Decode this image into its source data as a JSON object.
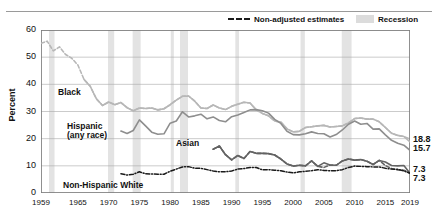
{
  "figure": {
    "title": "",
    "legend": [
      {
        "key": "non_adjusted",
        "label": "Non-adjusted estimates",
        "marker": "dashed-line"
      },
      {
        "key": "recession",
        "label": "Recession",
        "marker": "gray-band"
      }
    ],
    "end_labels": [
      "18.8",
      "15.7",
      "7.3",
      "7.3"
    ],
    "series_tags": {
      "black": "Black",
      "hispanic_line1": "Hispanic",
      "hispanic_line2": "(any race)",
      "asian": "Asian",
      "white": "Non-Hispanic White"
    }
  },
  "chart_data": {
    "type": "line",
    "title": "",
    "xlabel": "",
    "ylabel": "Percent",
    "xlim": [
      1959,
      2019
    ],
    "ylim": [
      0,
      60
    ],
    "ytick_labels": [
      "0",
      "10",
      "20",
      "30",
      "40",
      "50",
      "60"
    ],
    "ytick_values": [
      0,
      10,
      20,
      30,
      40,
      50,
      60
    ],
    "xtick_labels": [
      "1959",
      "1965",
      "1970",
      "1975",
      "1980",
      "1985",
      "1990",
      "1995",
      "2000",
      "2005",
      "2010",
      "2015",
      "2019"
    ],
    "xtick_values": [
      1959,
      1965,
      1970,
      1975,
      1980,
      1985,
      1990,
      1995,
      2000,
      2005,
      2010,
      2015,
      2019
    ],
    "grid": "horizontal",
    "legend_position": "top-right",
    "colors": {
      "black": "#b7b7b7",
      "hispanic": "#8e8e8e",
      "asian": "#636363",
      "white": "#1a1a1a",
      "recession_band": "#e3e3e3",
      "axis": "#7d7d7d"
    },
    "recession_bands": [
      {
        "start": 1960.3,
        "end": 1961.2
      },
      {
        "start": 1969.9,
        "end": 1970.9
      },
      {
        "start": 1973.9,
        "end": 1975.2
      },
      {
        "start": 1980.1,
        "end": 1980.6
      },
      {
        "start": 1981.6,
        "end": 1982.9
      },
      {
        "start": 1990.6,
        "end": 1991.2
      },
      {
        "start": 2001.2,
        "end": 2001.9
      },
      {
        "start": 2007.9,
        "end": 2009.5
      }
    ],
    "series": [
      {
        "name": "Black",
        "style": "solid",
        "color": "#b7b7b7",
        "end_value": 18.8,
        "x": [
          1966,
          1967,
          1968,
          1969,
          1970,
          1971,
          1972,
          1973,
          1974,
          1975,
          1976,
          1977,
          1978,
          1979,
          1980,
          1981,
          1982,
          1983,
          1984,
          1985,
          1986,
          1987,
          1988,
          1989,
          1990,
          1991,
          1992,
          1993,
          1994,
          1995,
          1996,
          1997,
          1998,
          1999,
          2000,
          2001,
          2002,
          2003,
          2004,
          2005,
          2006,
          2007,
          2008,
          2009,
          2010,
          2011,
          2012,
          2013,
          2014,
          2015,
          2016,
          2017,
          2018,
          2019
        ],
        "y": [
          41.8,
          39.3,
          34.7,
          32.2,
          33.5,
          32.5,
          33.3,
          31.4,
          30.3,
          31.3,
          31.1,
          31.3,
          30.6,
          31.0,
          32.5,
          34.2,
          35.6,
          35.7,
          33.8,
          31.3,
          31.1,
          32.4,
          31.3,
          30.7,
          31.9,
          32.7,
          33.4,
          33.1,
          30.6,
          29.3,
          28.4,
          26.5,
          26.1,
          23.6,
          22.5,
          22.7,
          24.1,
          24.4,
          24.7,
          24.9,
          24.3,
          24.5,
          24.7,
          25.8,
          27.4,
          27.6,
          27.2,
          27.2,
          26.2,
          24.1,
          22.0,
          21.2,
          20.8,
          18.8
        ]
      },
      {
        "name": "Black (non-adjusted)",
        "style": "dashed",
        "color": "#b7b7b7",
        "x": [
          1959,
          1960,
          1961,
          1962,
          1963,
          1964,
          1965,
          1966,
          1967,
          1968,
          1969,
          1970,
          1971,
          1972,
          1973,
          1974,
          1975,
          1976,
          1977,
          1978,
          1979,
          1980,
          1981,
          1982,
          1983,
          1984,
          1985,
          1986,
          1987,
          1988,
          1989,
          1990,
          1991,
          1992,
          1993,
          1994,
          1995,
          1996,
          1997,
          1998,
          1999,
          2000,
          2001,
          2002,
          2003,
          2004,
          2005,
          2006,
          2007,
          2008,
          2009,
          2010,
          2011,
          2012,
          2013,
          2014,
          2015,
          2016,
          2017,
          2018,
          2019
        ],
        "y": [
          55.1,
          55.9,
          52.3,
          53.8,
          51.0,
          49.6,
          47.1,
          41.8,
          39.3,
          34.7,
          32.2,
          33.5,
          32.5,
          33.3,
          31.4,
          30.3,
          31.3,
          31.1,
          31.3,
          30.6,
          31.0,
          32.5,
          34.2,
          35.6,
          35.7,
          33.8,
          31.3,
          31.1,
          32.4,
          31.3,
          30.7,
          31.9,
          32.7,
          33.4,
          33.1,
          30.6,
          29.3,
          28.4,
          26.5,
          26.1,
          23.6,
          22.5,
          22.7,
          24.1,
          24.4,
          24.7,
          24.9,
          24.3,
          24.5,
          24.7,
          25.8,
          27.4,
          27.6,
          27.2,
          27.2,
          26.2,
          24.1,
          22.0,
          21.2,
          20.8,
          19.9
        ]
      },
      {
        "name": "Hispanic (any race)",
        "style": "solid",
        "color": "#8e8e8e",
        "end_value": 15.7,
        "x": [
          1972,
          1973,
          1974,
          1975,
          1976,
          1977,
          1978,
          1979,
          1980,
          1981,
          1982,
          1983,
          1984,
          1985,
          1986,
          1987,
          1988,
          1989,
          1990,
          1991,
          1992,
          1993,
          1994,
          1995,
          1996,
          1997,
          1998,
          1999,
          2000,
          2001,
          2002,
          2003,
          2004,
          2005,
          2006,
          2007,
          2008,
          2009,
          2010,
          2011,
          2012,
          2013,
          2014,
          2015,
          2016,
          2017,
          2018,
          2019
        ],
        "y": [
          22.8,
          21.9,
          23.0,
          26.9,
          24.7,
          22.4,
          21.6,
          21.8,
          25.7,
          26.5,
          29.9,
          28.0,
          28.4,
          29.0,
          27.3,
          28.0,
          26.7,
          26.2,
          28.1,
          28.7,
          29.6,
          30.6,
          30.7,
          30.3,
          29.4,
          27.1,
          25.6,
          22.7,
          21.5,
          21.4,
          21.8,
          22.5,
          21.9,
          21.8,
          20.6,
          21.5,
          23.2,
          25.3,
          26.5,
          25.3,
          25.6,
          23.5,
          23.6,
          21.4,
          19.4,
          18.3,
          17.6,
          15.7
        ]
      },
      {
        "name": "Asian",
        "style": "solid",
        "color": "#636363",
        "end_value": 7.3,
        "x": [
          1987,
          1988,
          1989,
          1990,
          1991,
          1992,
          1993,
          1994,
          1995,
          1996,
          1997,
          1998,
          1999,
          2000,
          2001,
          2002,
          2003,
          2004,
          2005,
          2006,
          2007,
          2008,
          2009,
          2010,
          2011,
          2012,
          2013,
          2014,
          2015,
          2016,
          2017,
          2018,
          2019
        ],
        "y": [
          16.1,
          17.3,
          14.1,
          12.2,
          13.8,
          12.7,
          15.3,
          14.6,
          14.6,
          14.5,
          14.0,
          12.5,
          10.7,
          9.9,
          10.2,
          10.0,
          11.8,
          9.8,
          11.1,
          10.3,
          10.2,
          11.8,
          12.5,
          12.1,
          12.3,
          11.7,
          10.5,
          12.0,
          11.4,
          10.1,
          10.0,
          10.1,
          7.3
        ]
      },
      {
        "name": "Asian (non-adjusted)",
        "style": "dashed",
        "color": "#636363",
        "x": [
          1987,
          1988,
          1989,
          1990,
          1991,
          1992,
          1993,
          1994,
          1995,
          1996,
          1997,
          1998,
          1999,
          2000,
          2001,
          2002,
          2003,
          2004,
          2005,
          2006,
          2007,
          2008,
          2009,
          2010,
          2011,
          2012,
          2013,
          2014,
          2015,
          2016,
          2017,
          2018,
          2019
        ],
        "y": [
          16.1,
          17.3,
          14.1,
          12.2,
          13.8,
          12.7,
          15.3,
          14.6,
          14.6,
          14.5,
          14.0,
          12.5,
          10.7,
          9.9,
          10.2,
          10.0,
          11.8,
          9.8,
          9.4,
          10.3,
          10.2,
          11.8,
          12.5,
          12.1,
          12.3,
          11.7,
          10.5,
          12.0,
          10.1,
          9.0,
          8.5,
          8.4,
          7.3
        ]
      },
      {
        "name": "Non-Hispanic White",
        "style": "dash-dot",
        "color": "#1a1a1a",
        "end_value": 7.3,
        "x": [
          1972,
          1973,
          1974,
          1975,
          1976,
          1977,
          1978,
          1979,
          1980,
          1981,
          1982,
          1983,
          1984,
          1985,
          1986,
          1987,
          1988,
          1989,
          1990,
          1991,
          1992,
          1993,
          1994,
          1995,
          1996,
          1997,
          1998,
          1999,
          2000,
          2001,
          2002,
          2003,
          2004,
          2005,
          2006,
          2007,
          2008,
          2009,
          2010,
          2011,
          2012,
          2013,
          2014,
          2015,
          2016,
          2017,
          2018,
          2019
        ],
        "y": [
          7.1,
          6.6,
          6.9,
          7.8,
          7.1,
          7.0,
          6.9,
          6.9,
          8.0,
          8.8,
          9.6,
          9.7,
          9.1,
          9.1,
          8.6,
          8.1,
          7.8,
          7.8,
          8.1,
          8.8,
          9.0,
          9.4,
          9.4,
          8.5,
          8.6,
          8.4,
          8.2,
          7.7,
          7.4,
          7.8,
          8.0,
          8.2,
          8.6,
          8.3,
          8.2,
          8.2,
          8.6,
          9.4,
          9.9,
          9.8,
          9.7,
          9.6,
          9.6,
          9.1,
          8.8,
          8.7,
          8.1,
          7.3
        ]
      }
    ]
  }
}
